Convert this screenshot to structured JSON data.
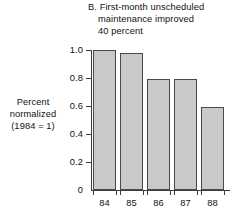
{
  "chart_data": {
    "type": "bar",
    "title": "B. First-month unscheduled maintenance improved 40 percent",
    "title_lines": [
      "B. First-month unscheduled",
      "maintenance improved",
      "40 percent"
    ],
    "ylabel_lines": [
      "Percent",
      "normalized",
      "(1984 = 1)"
    ],
    "ylabel": "Percent normalized (1984 = 1)",
    "xlabel": "",
    "categories": [
      "84",
      "85",
      "86",
      "87",
      "88"
    ],
    "values": [
      1.0,
      0.98,
      0.79,
      0.79,
      0.59
    ],
    "ylim": [
      0,
      1.0
    ],
    "yticks": [
      "0",
      "0.2",
      "0.4",
      "0.6",
      "0.8",
      "1.0"
    ],
    "ytick_values": [
      0,
      0.2,
      0.4,
      0.6,
      0.8,
      1.0
    ],
    "grid": false,
    "legend": "none",
    "bar_color": "#c9c9c9",
    "bar_edge_color": "#4a4a4a",
    "axis_color": "#3d3d3d",
    "background_color": "#ffffff"
  }
}
